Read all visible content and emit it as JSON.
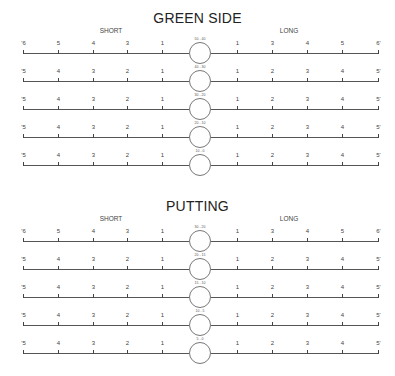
{
  "sections": [
    {
      "title": "GREEN SIDE",
      "short_label": "SHORT",
      "long_label": "LONG",
      "rows": [
        {
          "range": "50 - 40",
          "short": [
            "'6",
            "5",
            "4",
            "3",
            "1"
          ],
          "long": [
            "1",
            "3",
            "4",
            "5",
            "6'"
          ]
        },
        {
          "range": "40 - 30",
          "short": [
            "'5",
            "4",
            "3",
            "2",
            "1"
          ],
          "long": [
            "1",
            "2",
            "3",
            "4",
            "5'"
          ]
        },
        {
          "range": "30 - 20",
          "short": [
            "'5",
            "4",
            "3",
            "2",
            "1"
          ],
          "long": [
            "1",
            "2",
            "3",
            "4",
            "5'"
          ]
        },
        {
          "range": "20 - 10",
          "short": [
            "'5",
            "4",
            "3",
            "2",
            "1"
          ],
          "long": [
            "1",
            "2",
            "3",
            "4",
            "5'"
          ]
        },
        {
          "range": "10 - 0",
          "short": [
            "'5",
            "4",
            "3",
            "2",
            "1"
          ],
          "long": [
            "1",
            "2",
            "3",
            "4",
            "5'"
          ]
        }
      ]
    },
    {
      "title": "PUTTING",
      "short_label": "SHORT",
      "long_label": "LONG",
      "rows": [
        {
          "range": "30 - 20",
          "short": [
            "'6",
            "5",
            "4",
            "3",
            "1"
          ],
          "long": [
            "1",
            "3",
            "4",
            "5",
            "6'"
          ]
        },
        {
          "range": "20 - 15",
          "short": [
            "'5",
            "4",
            "3",
            "2",
            "1"
          ],
          "long": [
            "1",
            "2",
            "3",
            "4",
            "5'"
          ]
        },
        {
          "range": "15 - 10",
          "short": [
            "'5",
            "4",
            "3",
            "2",
            "1"
          ],
          "long": [
            "1",
            "2",
            "3",
            "4",
            "5'"
          ]
        },
        {
          "range": "10 - 5",
          "short": [
            "'5",
            "4",
            "3",
            "2",
            "1"
          ],
          "long": [
            "1",
            "2",
            "3",
            "4",
            "5'"
          ]
        },
        {
          "range": "5 - 0",
          "short": [
            "'5",
            "4",
            "3",
            "2",
            "1"
          ],
          "long": [
            "1",
            "2",
            "3",
            "4",
            "5'"
          ]
        }
      ]
    }
  ]
}
